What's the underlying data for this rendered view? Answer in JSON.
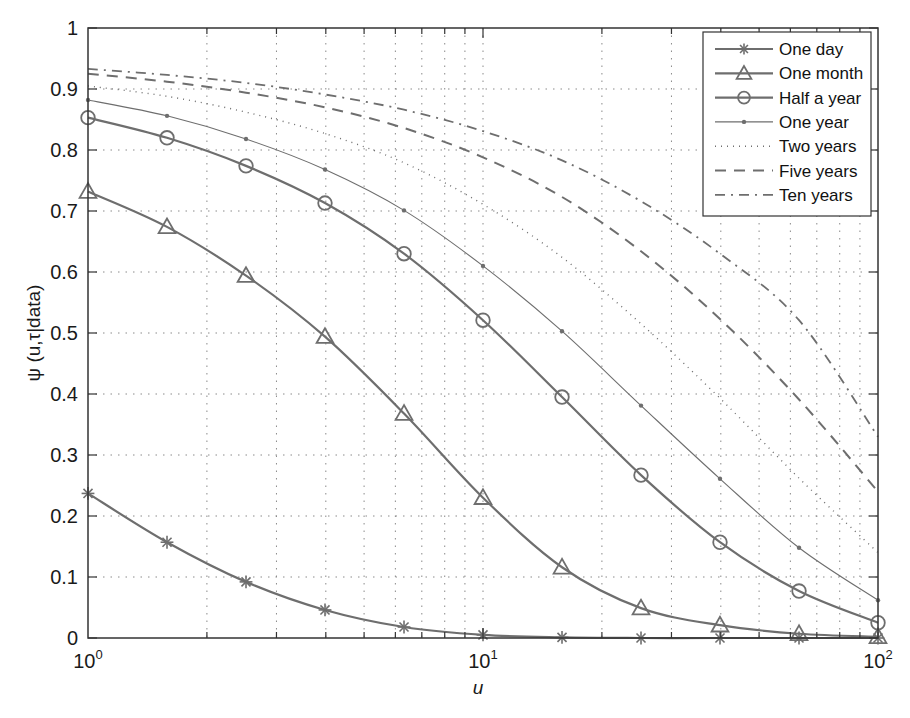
{
  "chart_data": {
    "type": "line",
    "title": "",
    "xlabel": "u",
    "ylabel": "ψ (u,τ|data)",
    "xscale": "log",
    "xlim": [
      1,
      100
    ],
    "ylim": [
      0,
      1
    ],
    "grid": true,
    "legend_position": "upper right",
    "x_tick_labels": [
      "10^0",
      "10^1",
      "10^2"
    ],
    "y_tick_labels": [
      "0",
      "0.1",
      "0.2",
      "0.3",
      "0.4",
      "0.5",
      "0.6",
      "0.7",
      "0.8",
      "0.9",
      "1"
    ],
    "x": [
      1,
      1.585,
      2.512,
      3.981,
      6.31,
      10,
      15.85,
      25.12,
      39.81,
      63.1,
      100
    ],
    "series": [
      {
        "name": "One day",
        "style": "solid",
        "marker": "asterisk",
        "values": [
          0.237,
          0.157,
          0.092,
          0.046,
          0.018,
          0.005,
          0.001,
          0.0,
          0.0,
          0.0,
          0.0
        ]
      },
      {
        "name": "One month",
        "style": "solid",
        "marker": "triangle",
        "values": [
          0.732,
          0.674,
          0.594,
          0.494,
          0.368,
          0.23,
          0.116,
          0.049,
          0.021,
          0.007,
          0.002
        ]
      },
      {
        "name": "Half a year",
        "style": "solid",
        "marker": "circle",
        "values": [
          0.853,
          0.82,
          0.774,
          0.713,
          0.63,
          0.521,
          0.395,
          0.267,
          0.157,
          0.077,
          0.025
        ]
      },
      {
        "name": "One year",
        "style": "thin",
        "marker": "dot",
        "values": [
          0.882,
          0.856,
          0.818,
          0.768,
          0.701,
          0.61,
          0.503,
          0.381,
          0.261,
          0.148,
          0.062
        ]
      },
      {
        "name": "Two years",
        "style": "dotted",
        "marker": "none",
        "values": [
          0.905,
          0.888,
          0.862,
          0.827,
          0.779,
          0.711,
          0.624,
          0.515,
          0.393,
          0.262,
          0.14
        ]
      },
      {
        "name": "Five years",
        "style": "dashed",
        "marker": "none",
        "values": [
          0.925,
          0.912,
          0.894,
          0.87,
          0.836,
          0.788,
          0.723,
          0.634,
          0.523,
          0.391,
          0.24
        ]
      },
      {
        "name": "Ten years",
        "style": "dashdot",
        "marker": "none",
        "values": [
          0.933,
          0.923,
          0.91,
          0.891,
          0.866,
          0.831,
          0.783,
          0.716,
          0.63,
          0.521,
          0.33
        ]
      }
    ]
  },
  "colors": {
    "line": "#6e6e6e",
    "axis": "#333333",
    "grid": "#8a8a8a"
  }
}
